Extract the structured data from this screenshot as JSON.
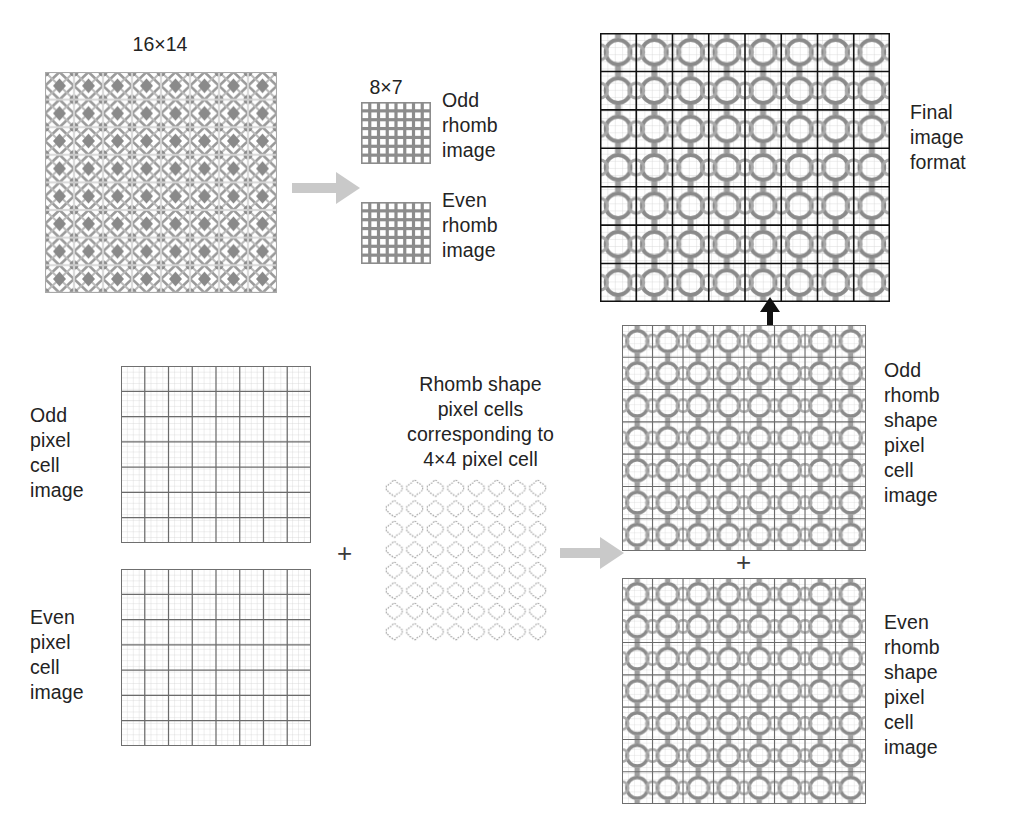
{
  "figure": {
    "type": "diagram"
  },
  "labels": {
    "source_size": "16×14",
    "sub_size": "8×7",
    "odd_rhomb_image": "Odd\nrhomb\nimage",
    "even_rhomb_image": "Even\nrhomb\nimage",
    "final_image_format": "Final\nimage\nformat",
    "odd_pixel_cell_image": "Odd\npixel\ncell\nimage",
    "even_pixel_cell_image": "Even\npixel\ncell\nimage",
    "rhomb_shape_note": "Rhomb shape\npixel cells\ncorresponding to\n4×4 pixel cell",
    "odd_rhomb_shape_pixel_cell_image": "Odd\nrhomb\nshape\npixel\ncell\nimage",
    "even_rhomb_shape_pixel_cell_image": "Even\nrhomb\nshape\npixel\ncell\nimage",
    "plus_middle": "+",
    "plus_right": "+"
  },
  "colors": {
    "ink": "#232323",
    "grid_dark": "#4a4a4a",
    "grid_light": "#bdbdbd",
    "rhomb_gray": "#8a8a8a",
    "arrow_gray": "#c9c9c9",
    "arrow_black": "#111111",
    "panel_border": "#9a9a9a",
    "background": "#ffffff"
  },
  "panels": [
    {
      "name": "source-rhomb-pattern",
      "size": "16×14",
      "cols": 16,
      "rows": 14
    },
    {
      "name": "odd-rhomb-thumb",
      "size": "8×7",
      "cols": 8,
      "rows": 7
    },
    {
      "name": "even-rhomb-thumb",
      "size": "8×7",
      "cols": 8,
      "rows": 7
    },
    {
      "name": "final-image",
      "cols": 8,
      "rows": 7
    },
    {
      "name": "odd-pixel-cell-grid",
      "cols": 8,
      "rows": 7
    },
    {
      "name": "even-pixel-cell-grid",
      "cols": 8,
      "rows": 7
    },
    {
      "name": "rhomb-cell-tile",
      "cols": 8,
      "rows": 8
    },
    {
      "name": "odd-rhomb-shape-grid",
      "cols": 8,
      "rows": 7
    },
    {
      "name": "even-rhomb-shape-grid",
      "cols": 8,
      "rows": 7
    }
  ]
}
